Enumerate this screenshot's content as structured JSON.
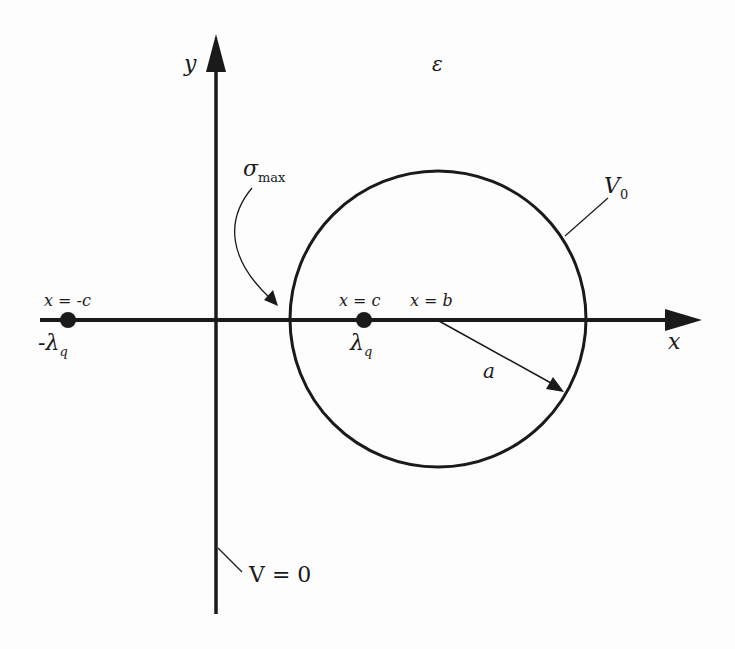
{
  "diagram": {
    "axes": {
      "x_label": "x",
      "y_label": "y"
    },
    "medium_label": "ε",
    "circle": {
      "potential_label": "V",
      "potential_subscript": "0",
      "radius_label": "a",
      "center_label": "x = b"
    },
    "plane": {
      "label": "V = 0"
    },
    "sigma_label": "σ",
    "sigma_subscript": "max",
    "charges": [
      {
        "position_label": "x = -c",
        "charge_prefix": "-λ",
        "charge_subscript": "q"
      },
      {
        "position_label": "x = c",
        "charge_prefix": "λ",
        "charge_subscript": "q"
      }
    ]
  }
}
